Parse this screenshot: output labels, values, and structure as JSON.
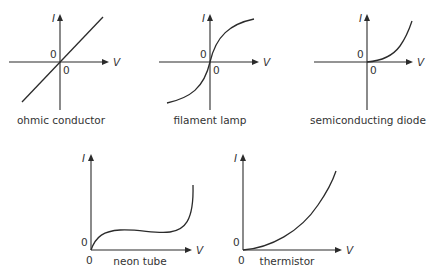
{
  "axis_labels": {
    "y": "I",
    "x": "V",
    "origin": "0"
  },
  "graphs": [
    {
      "caption": "ohmic conductor",
      "shape": "straight line through origin"
    },
    {
      "caption": "filament lamp",
      "shape": "S-curve through origin, flattening at high |V|"
    },
    {
      "caption": "semiconducting diode",
      "shape": "zero current for V<0, rising steeply for V>0"
    },
    {
      "caption": "neon tube",
      "shape": "rises, plateaus, then rises sharply"
    },
    {
      "caption": "thermistor",
      "shape": "curve rising increasingly steeply from origin"
    }
  ],
  "colors": {
    "line": "#2b2b2b",
    "text": "#333333",
    "background": "#ffffff"
  }
}
